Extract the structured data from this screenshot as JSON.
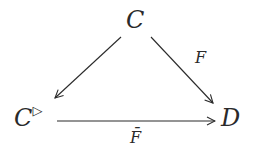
{
  "diagram": {
    "nodes": {
      "top": {
        "label": "C"
      },
      "left": {
        "label": "C",
        "superscript": "▷"
      },
      "right": {
        "label": "D"
      }
    },
    "edges": [
      {
        "from": "top",
        "to": "left",
        "label": ""
      },
      {
        "from": "top",
        "to": "right",
        "label": "F"
      },
      {
        "from": "left",
        "to": "right",
        "label": "F̄"
      }
    ],
    "colors": {
      "stroke": "#2a2a2a",
      "background": "#ffffff"
    }
  }
}
